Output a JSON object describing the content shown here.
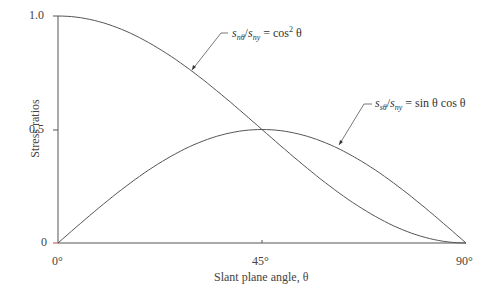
{
  "chart_data": {
    "type": "line",
    "title": "",
    "xlabel": "Slant plane angle, θ",
    "ylabel": "Stress ratios",
    "x_ticks": [
      "0°",
      "45°",
      "90°"
    ],
    "y_ticks": [
      "0",
      "0.5",
      "1.0"
    ],
    "xlim": [
      0,
      90
    ],
    "ylim": [
      0,
      1.0
    ],
    "grid": false,
    "x": [
      0,
      15,
      30,
      45,
      60,
      75,
      90
    ],
    "series": [
      {
        "name": "s_nθ/s_ny = cos² θ",
        "values": [
          1.0,
          0.933,
          0.75,
          0.5,
          0.25,
          0.067,
          0.0
        ]
      },
      {
        "name": "s_sθ/s_ny = sin θ cos θ",
        "values": [
          0.0,
          0.25,
          0.433,
          0.5,
          0.433,
          0.25,
          0.0
        ]
      }
    ],
    "annotations": [
      {
        "text": "s_nθ/s_ny = cos² θ",
        "points_to": "cos² curve"
      },
      {
        "text": "s_sθ/s_ny = sin θ cos θ",
        "points_to": "sin cos curve"
      }
    ]
  },
  "labels": {
    "y_tick_0": "0",
    "y_tick_05": "0.5",
    "y_tick_1": "1.0",
    "x_tick_0": "0°",
    "x_tick_45": "45°",
    "x_tick_90": "90°",
    "xlabel": "Slant plane angle, θ",
    "ylabel": "Stress ratios",
    "annot1_s": "s",
    "annot1_sub1": "nθ",
    "annot1_slash": "/",
    "annot1_sub2": "ny",
    "annot1_eq": " = cos",
    "annot1_sup": "2",
    "annot1_tail": " θ",
    "annot2_s": "s",
    "annot2_sub1": "sθ",
    "annot2_sub2": "ny",
    "annot2_eq": " = sin θ cos θ"
  }
}
